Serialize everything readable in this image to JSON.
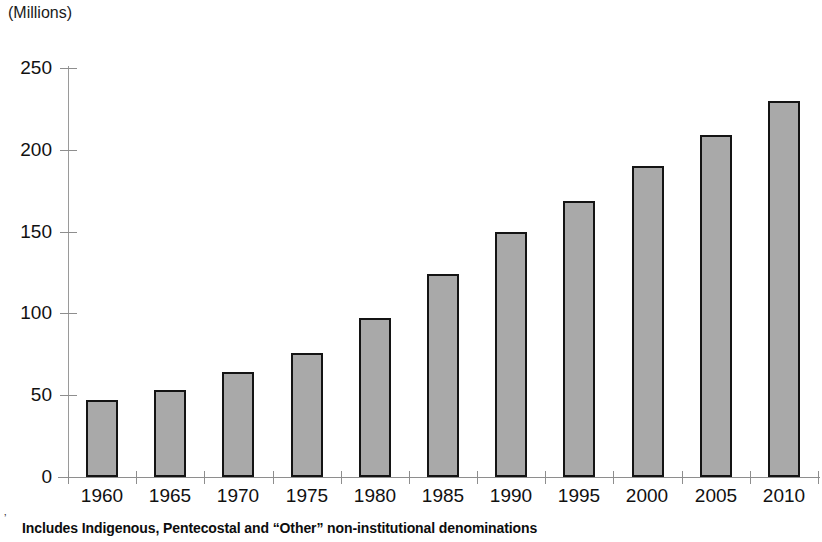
{
  "units_label": "(Millions)",
  "footnote": {
    "mark": "’",
    "text": "Includes Indigenous, Pentecostal and “Other” non-institutional denominations"
  },
  "axis": {
    "y_tick_labels": [
      "250",
      "200",
      "150",
      "100",
      "50",
      "0"
    ],
    "y_tick_values": [
      250,
      200,
      150,
      100,
      50,
      0
    ]
  },
  "style": {
    "bar_fill": "#a9a9a9",
    "bar_border": "#141414",
    "axis_color": "#8e8e8e",
    "text_color": "#111111",
    "background": "#ffffff"
  },
  "chart_data": {
    "type": "bar",
    "title": "",
    "subtitle": "",
    "xlabel": "",
    "ylabel": "(Millions)",
    "ylim": [
      0,
      250
    ],
    "ytick_step": 50,
    "grid": false,
    "legend": false,
    "categories": [
      "1960",
      "1965",
      "1970",
      "1975",
      "1980",
      "1985",
      "1990",
      "1995",
      "2000",
      "2005",
      "2010"
    ],
    "values": [
      47,
      53,
      64,
      76,
      97,
      124,
      150,
      169,
      190,
      209,
      230
    ],
    "series": [
      {
        "name": "Independent Christians",
        "values": [
          47,
          53,
          64,
          76,
          97,
          124,
          150,
          169,
          190,
          209,
          230
        ]
      }
    ],
    "annotations": [
      "Includes Indigenous, Pentecostal and “Other” non-institutional denominations"
    ]
  }
}
